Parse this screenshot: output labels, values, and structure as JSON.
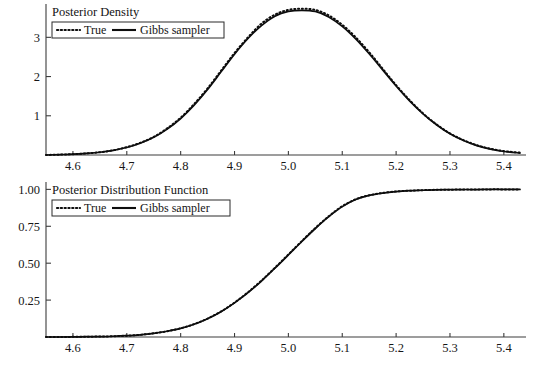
{
  "figure": {
    "background": "#ffffff",
    "ink_color": "#0d0d0d",
    "axis_color": "#3c3c3c"
  },
  "chart_data": [
    {
      "type": "line",
      "title": "Posterior Density",
      "xlabel": "",
      "ylabel": "",
      "xlim": [
        4.55,
        5.43
      ],
      "ylim": [
        0,
        3.85
      ],
      "grid": false,
      "legend_position": "top-left",
      "xticks": [
        4.6,
        4.7,
        4.8,
        4.9,
        5.0,
        5.1,
        5.2,
        5.3,
        5.4
      ],
      "xtick_labels": [
        "4.6",
        "4.7",
        "4.8",
        "4.9",
        "5.0",
        "5.1",
        "5.2",
        "5.3",
        "5.4"
      ],
      "yticks": [
        1,
        2,
        3
      ],
      "ytick_labels": [
        "1",
        "2",
        "3"
      ],
      "x": [
        4.55,
        4.575,
        4.6,
        4.625,
        4.65,
        4.675,
        4.7,
        4.725,
        4.75,
        4.775,
        4.8,
        4.825,
        4.85,
        4.875,
        4.9,
        4.925,
        4.95,
        4.975,
        5.0,
        5.025,
        5.05,
        5.075,
        5.1,
        5.125,
        5.15,
        5.175,
        5.2,
        5.225,
        5.25,
        5.275,
        5.3,
        5.325,
        5.35,
        5.375,
        5.4,
        5.43
      ],
      "series": [
        {
          "name": "True",
          "style": "dotted",
          "values": [
            0.0,
            0.01,
            0.02,
            0.04,
            0.07,
            0.12,
            0.2,
            0.31,
            0.46,
            0.68,
            0.95,
            1.3,
            1.7,
            2.15,
            2.6,
            3.0,
            3.35,
            3.58,
            3.7,
            3.73,
            3.7,
            3.56,
            3.32,
            3.0,
            2.62,
            2.2,
            1.78,
            1.4,
            1.06,
            0.78,
            0.55,
            0.38,
            0.25,
            0.16,
            0.1,
            0.06
          ]
        },
        {
          "name": "Gibbs sampler",
          "style": "solid",
          "values": [
            0.0,
            0.01,
            0.02,
            0.04,
            0.07,
            0.12,
            0.19,
            0.3,
            0.45,
            0.66,
            0.93,
            1.27,
            1.67,
            2.12,
            2.57,
            2.97,
            3.3,
            3.54,
            3.66,
            3.69,
            3.66,
            3.52,
            3.28,
            2.96,
            2.58,
            2.17,
            1.76,
            1.38,
            1.05,
            0.77,
            0.54,
            0.37,
            0.24,
            0.15,
            0.09,
            0.05
          ]
        }
      ],
      "legend": [
        {
          "label": "True",
          "style": "dotted"
        },
        {
          "label": "Gibbs sampler",
          "style": "solid"
        }
      ]
    },
    {
      "type": "line",
      "title": "Posterior Distribution Function",
      "xlabel": "",
      "ylabel": "",
      "xlim": [
        4.55,
        5.43
      ],
      "ylim": [
        0,
        1.05
      ],
      "grid": false,
      "legend_position": "top-left",
      "xticks": [
        4.6,
        4.7,
        4.8,
        4.9,
        5.0,
        5.1,
        5.2,
        5.3,
        5.4
      ],
      "xtick_labels": [
        "4.6",
        "4.7",
        "4.8",
        "4.9",
        "5.0",
        "5.1",
        "5.2",
        "5.3",
        "5.4"
      ],
      "yticks": [
        0.25,
        0.5,
        0.75,
        1.0
      ],
      "ytick_labels": [
        "0.25",
        "0.50",
        "0.75",
        "1.00"
      ],
      "x": [
        4.55,
        4.575,
        4.6,
        4.625,
        4.65,
        4.675,
        4.7,
        4.725,
        4.75,
        4.775,
        4.8,
        4.825,
        4.85,
        4.875,
        4.9,
        4.925,
        4.95,
        4.975,
        5.0,
        5.025,
        5.05,
        5.075,
        5.1,
        5.125,
        5.15,
        5.175,
        5.2,
        5.225,
        5.25,
        5.275,
        5.3,
        5.325,
        5.35,
        5.375,
        5.4,
        5.43
      ],
      "series": [
        {
          "name": "True",
          "style": "dotted",
          "values": [
            0.0,
            0.0,
            0.001,
            0.002,
            0.003,
            0.005,
            0.009,
            0.015,
            0.025,
            0.039,
            0.059,
            0.087,
            0.125,
            0.173,
            0.233,
            0.303,
            0.382,
            0.469,
            0.559,
            0.65,
            0.738,
            0.818,
            0.886,
            0.933,
            0.96,
            0.976,
            0.986,
            0.991,
            0.995,
            0.997,
            0.998,
            0.999,
            0.999,
            1.0,
            1.0,
            1.0
          ]
        },
        {
          "name": "Gibbs sampler",
          "style": "solid",
          "values": [
            0.0,
            0.0,
            0.001,
            0.002,
            0.003,
            0.005,
            0.009,
            0.015,
            0.025,
            0.039,
            0.058,
            0.086,
            0.124,
            0.171,
            0.231,
            0.3,
            0.379,
            0.466,
            0.556,
            0.647,
            0.735,
            0.815,
            0.883,
            0.931,
            0.959,
            0.975,
            0.985,
            0.991,
            0.994,
            0.997,
            0.998,
            0.999,
            0.999,
            1.0,
            1.0,
            1.0
          ]
        }
      ],
      "legend": [
        {
          "label": "True",
          "style": "dotted"
        },
        {
          "label": "Gibbs sampler",
          "style": "solid"
        }
      ]
    }
  ]
}
